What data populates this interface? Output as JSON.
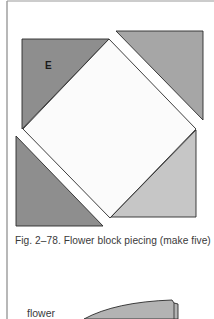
{
  "figure": {
    "piece_label": "E",
    "caption": "Fig. 2–78.  Flower block piecing (make five)",
    "next_figure_label": "flower"
  },
  "colors": {
    "page_background": "#ffffff",
    "frame_line": "#9a9a9a",
    "outline": "#2a2a2a",
    "dark_gray_fill": "#8e8e8e",
    "medium_gray_fill": "#a6a6a6",
    "light_gray_fill": "#c6c6c6",
    "center_square_fill": "#fbfbfb",
    "text": "#3a3a3a"
  },
  "pieces": [
    {
      "name": "top-left-triangle",
      "label": "E",
      "fill": "dark"
    },
    {
      "name": "top-right-triangle",
      "fill": "medium"
    },
    {
      "name": "center-square",
      "fill": "white"
    },
    {
      "name": "bottom-left-triangle",
      "fill": "dark"
    },
    {
      "name": "bottom-right-triangle",
      "fill": "light"
    }
  ]
}
